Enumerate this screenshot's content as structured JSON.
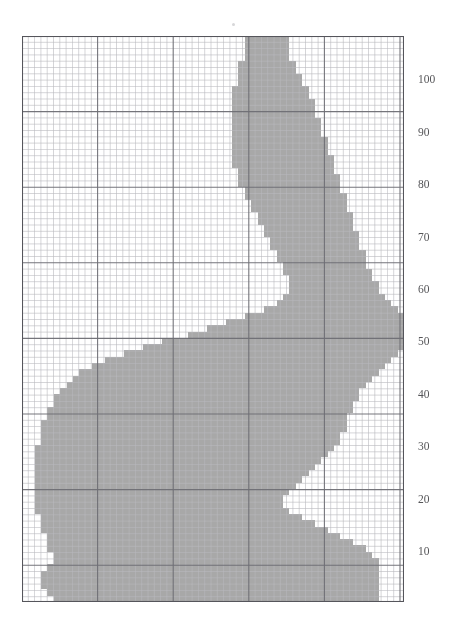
{
  "figure": {
    "title": "",
    "background_color": "#ffffff"
  },
  "chart_data": {
    "type": "heatmap",
    "title": "",
    "subtitle": "",
    "xlabel": "",
    "ylabel": "",
    "grid": true,
    "legend": null,
    "legend_position": "none",
    "axes": {
      "y_axis": {
        "visible": true,
        "side": "right",
        "tick_labels": [
          "100",
          "90",
          "80",
          "70",
          "60",
          "50",
          "40",
          "30",
          "20",
          "10"
        ],
        "tick_values": [
          100,
          90,
          80,
          70,
          60,
          50,
          40,
          30,
          20,
          10
        ],
        "ylim": [
          0,
          108
        ],
        "tick_interval": 10
      },
      "x_axis": {
        "visible": false,
        "tick_labels": [],
        "xlim": [
          0,
          60
        ]
      }
    },
    "grid_spec": {
      "minor_cell_px": 6.3,
      "major_every_minor_cells": 12,
      "minor_color": "#b9b9bd",
      "major_color": "#6e6e74",
      "border_color": "#55555b",
      "cols": 60,
      "rows": 90
    },
    "colors": {
      "fill": "#a8a8a8",
      "fill_light": "#b5b5b5",
      "background": "#ffffff",
      "label": "#555558"
    },
    "shape_outline_cells": {
      "note": "Per-row [start_col, end_col] spans of the filled silhouette, row 0 = top of plot, 90 rows of 60 columns",
      "spans": [
        [
          35,
          41
        ],
        [
          35,
          41
        ],
        [
          35,
          41
        ],
        [
          35,
          41
        ],
        [
          34,
          42
        ],
        [
          34,
          42
        ],
        [
          34,
          43
        ],
        [
          34,
          43
        ],
        [
          33,
          44
        ],
        [
          33,
          44
        ],
        [
          33,
          45
        ],
        [
          33,
          45
        ],
        [
          33,
          45
        ],
        [
          33,
          46
        ],
        [
          33,
          46
        ],
        [
          33,
          46
        ],
        [
          33,
          47
        ],
        [
          33,
          47
        ],
        [
          33,
          47
        ],
        [
          33,
          48
        ],
        [
          33,
          48
        ],
        [
          34,
          48
        ],
        [
          34,
          49
        ],
        [
          34,
          49
        ],
        [
          35,
          49
        ],
        [
          35,
          50
        ],
        [
          36,
          50
        ],
        [
          36,
          50
        ],
        [
          37,
          51
        ],
        [
          37,
          51
        ],
        [
          38,
          51
        ],
        [
          38,
          52
        ],
        [
          39,
          52
        ],
        [
          39,
          52
        ],
        [
          40,
          53
        ],
        [
          40,
          53
        ],
        [
          41,
          53
        ],
        [
          41,
          54
        ],
        [
          42,
          54
        ],
        [
          42,
          55
        ],
        [
          42,
          55
        ],
        [
          41,
          56
        ],
        [
          40,
          57
        ],
        [
          38,
          58
        ],
        [
          35,
          59
        ],
        [
          32,
          59
        ],
        [
          29,
          59
        ],
        [
          26,
          59
        ],
        [
          22,
          59
        ],
        [
          19,
          59
        ],
        [
          16,
          58
        ],
        [
          13,
          57
        ],
        [
          11,
          56
        ],
        [
          9,
          55
        ],
        [
          8,
          54
        ],
        [
          7,
          53
        ],
        [
          6,
          52
        ],
        [
          5,
          52
        ],
        [
          5,
          51
        ],
        [
          4,
          51
        ],
        [
          4,
          50
        ],
        [
          3,
          50
        ],
        [
          3,
          50
        ],
        [
          3,
          49
        ],
        [
          3,
          49
        ],
        [
          2,
          48
        ],
        [
          2,
          47
        ],
        [
          2,
          46
        ],
        [
          2,
          45
        ],
        [
          2,
          44
        ],
        [
          2,
          43
        ],
        [
          2,
          42
        ],
        [
          2,
          41
        ],
        [
          2,
          40
        ],
        [
          2,
          40
        ],
        [
          2,
          41
        ],
        [
          3,
          43
        ],
        [
          3,
          45
        ],
        [
          3,
          47
        ],
        [
          4,
          49
        ],
        [
          4,
          51
        ],
        [
          4,
          53
        ],
        [
          5,
          54
        ],
        [
          5,
          55
        ],
        [
          4,
          55
        ],
        [
          3,
          55
        ],
        [
          3,
          55
        ],
        [
          3,
          55
        ],
        [
          4,
          55
        ],
        [
          5,
          55
        ]
      ]
    }
  },
  "markers": {
    "top_speck": {
      "visible": true,
      "description": "faint gray speck above the plot area"
    }
  }
}
